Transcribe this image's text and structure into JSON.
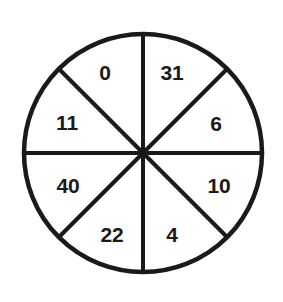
{
  "figure": {
    "name": "spinner-wheel",
    "background_color": "#ffffff"
  },
  "wheel": {
    "center_x": 143,
    "center_y": 153,
    "radius": 119,
    "sector_count": 8,
    "outline_color": "#1a1a1a",
    "outline_width": 4.5,
    "divider_color": "#1a1a1a",
    "divider_width": 4,
    "fill_color": "#ffffff",
    "label_color": "#1a1a1a",
    "label_font_size": 21,
    "label_radius": 74
  },
  "sectors": [
    {
      "label": "31",
      "name": "sector-31",
      "start_angle": -90,
      "end_angle": -45,
      "mid_angle": -67.5,
      "label_x": 172,
      "label_y": 72
    },
    {
      "label": "6",
      "name": "sector-6",
      "start_angle": -45,
      "end_angle": 0,
      "mid_angle": -22.5,
      "label_x": 216,
      "label_y": 123
    },
    {
      "label": "10",
      "name": "sector-10",
      "start_angle": 0,
      "end_angle": 45,
      "mid_angle": 22.5,
      "label_x": 219,
      "label_y": 185
    },
    {
      "label": "4",
      "name": "sector-4",
      "start_angle": 45,
      "end_angle": 90,
      "mid_angle": 67.5,
      "label_x": 172,
      "label_y": 234
    },
    {
      "label": "22",
      "name": "sector-22",
      "start_angle": 90,
      "end_angle": 135,
      "mid_angle": 112.5,
      "label_x": 112,
      "label_y": 234
    },
    {
      "label": "40",
      "name": "sector-40",
      "start_angle": 135,
      "end_angle": 180,
      "mid_angle": 157.5,
      "label_x": 68,
      "label_y": 185
    },
    {
      "label": "11",
      "name": "sector-11",
      "start_angle": 180,
      "end_angle": 225,
      "mid_angle": 202.5,
      "label_x": 67,
      "label_y": 122
    },
    {
      "label": "0",
      "name": "sector-0",
      "start_angle": 225,
      "end_angle": 270,
      "mid_angle": 247.5,
      "label_x": 105,
      "label_y": 72
    }
  ],
  "dividers": [
    {
      "name": "divider-vertical",
      "x1": 143,
      "y1": 34,
      "x2": 143,
      "y2": 272
    },
    {
      "name": "divider-horizontal",
      "x1": 24,
      "y1": 153,
      "x2": 262,
      "y2": 153
    },
    {
      "name": "divider-diagonal-nw-se",
      "x1": 59,
      "y1": 69,
      "x2": 227,
      "y2": 237
    },
    {
      "name": "divider-diagonal-ne-sw",
      "x1": 227,
      "y1": 69,
      "x2": 59,
      "y2": 237
    }
  ]
}
